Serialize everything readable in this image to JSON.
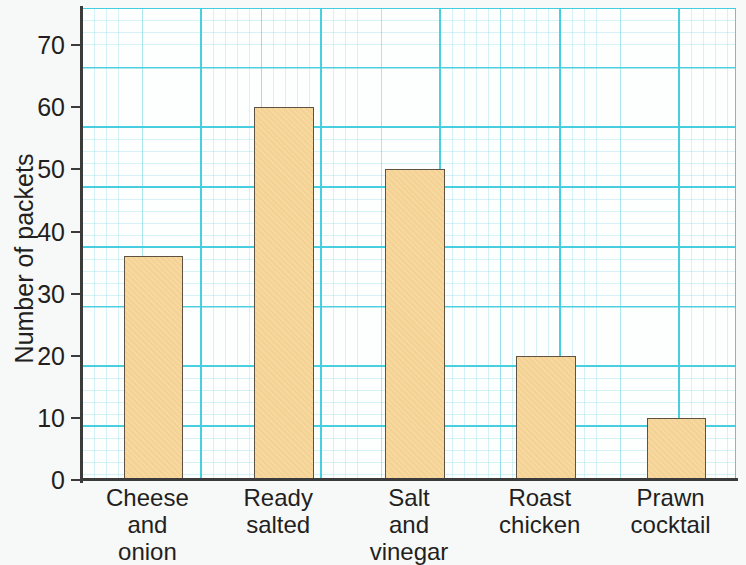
{
  "chart_data": {
    "type": "bar",
    "title": "",
    "xlabel": "",
    "ylabel": "Number of packets",
    "categories": [
      "Cheese and onion",
      "Ready salted",
      "Salt and vinegar",
      "Roast chicken",
      "Prawn cocktail"
    ],
    "category_lines": [
      [
        "Cheese",
        "and",
        "onion"
      ],
      [
        "Ready",
        "salted"
      ],
      [
        "Salt",
        "and",
        "vinegar"
      ],
      [
        "Roast",
        "chicken"
      ],
      [
        "Prawn",
        "cocktail"
      ]
    ],
    "values": [
      36,
      60,
      50,
      20,
      10
    ],
    "ylim": [
      0,
      76
    ],
    "yticks": [
      0,
      10,
      20,
      30,
      40,
      50,
      60,
      70
    ],
    "ytick_labels": [
      "0",
      "10",
      "20",
      "30",
      "40",
      "50",
      "60",
      "70"
    ],
    "grid": true,
    "grid_style": "graph-paper",
    "legend": "none",
    "bar_fill_color": "#f6d495",
    "bar_border_color": "#5e5243",
    "grid_color": "#40cdde",
    "axis_color": "#3b3b3b",
    "background_color": "#f7f8f8"
  }
}
